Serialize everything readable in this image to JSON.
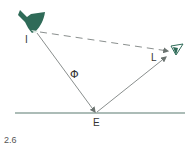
{
  "diagram": {
    "figure_number": "2.6",
    "labels": {
      "source": "I",
      "incidence_angle": "Φ",
      "reflection_point": "E",
      "observer": "L"
    },
    "elements": {
      "light_source": {
        "icon": "lamp-icon",
        "color": "#2f6b58"
      },
      "observer": {
        "icon": "eye-icon",
        "color": "#2f6b58"
      },
      "direct_ray": {
        "style": "dashed",
        "from": "I",
        "to": "L"
      },
      "incident_ray": {
        "style": "solid",
        "from": "I",
        "to": "E"
      },
      "reflected_ray": {
        "style": "solid",
        "from": "E",
        "to": "L"
      },
      "surface": {
        "style": "solid",
        "color": "#5a7a70"
      }
    },
    "colors": {
      "line": "#6b7d78",
      "ray": "#8a8f8e",
      "accent": "#2f6b58"
    }
  }
}
